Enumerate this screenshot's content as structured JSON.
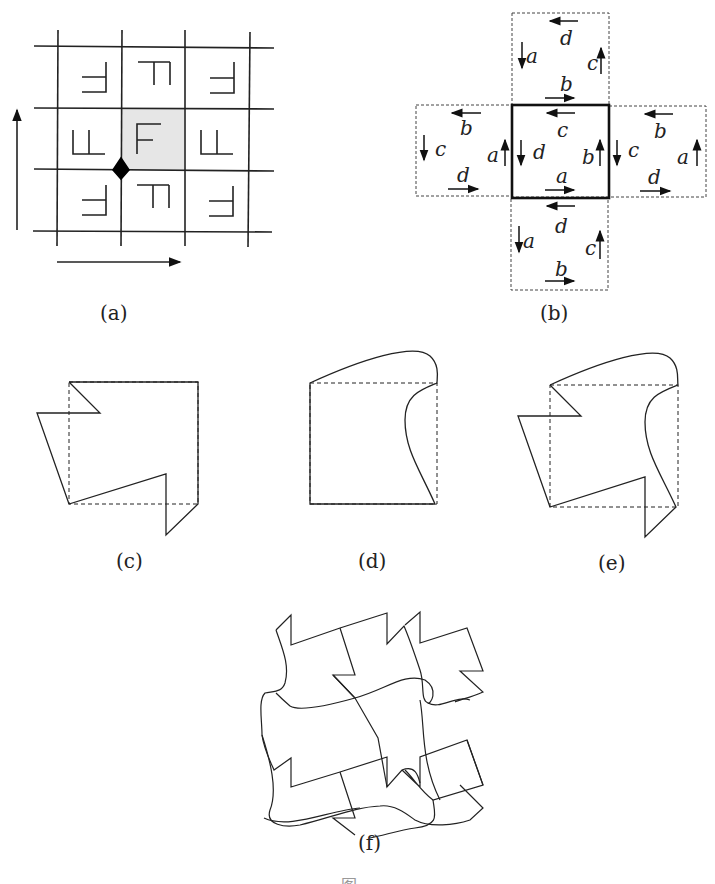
{
  "figure": {
    "subfigures": [
      {
        "id": "a",
        "caption": "(a)",
        "description": "3x3 grid of F tiles with shaded central tile, rotation point marked by diamond, horizontal and vertical translation arrows"
      },
      {
        "id": "b",
        "caption": "(b)",
        "description": "Central square with edge labels and four dashed neighboring squares"
      },
      {
        "id": "c",
        "caption": "(c)",
        "description": "Square with zigzag modifications on left and bottom edges"
      },
      {
        "id": "d",
        "caption": "(d)",
        "description": "Square with curved modifications on top and right edges"
      },
      {
        "id": "e",
        "caption": "(e)",
        "description": "Combined modified tile"
      },
      {
        "id": "f",
        "caption": "(f)",
        "description": "Tessellation of modified tiles"
      }
    ],
    "panel_b": {
      "center": {
        "top": "c",
        "left": "d",
        "right": "b",
        "bottom": "a"
      },
      "top": {
        "top": "d",
        "left": "a",
        "right": "c",
        "bottom": "b"
      },
      "left": {
        "top": "b",
        "left": "c",
        "right": "a",
        "bottom": "d"
      },
      "right": {
        "top": "b",
        "left": "c",
        "right": "a",
        "bottom": "d"
      },
      "bottom": {
        "top": "d",
        "left": "a",
        "right": "c",
        "bottom": "b"
      }
    },
    "panel_a": {
      "center_glyph": "F"
    },
    "caption_partial": "图 …"
  }
}
